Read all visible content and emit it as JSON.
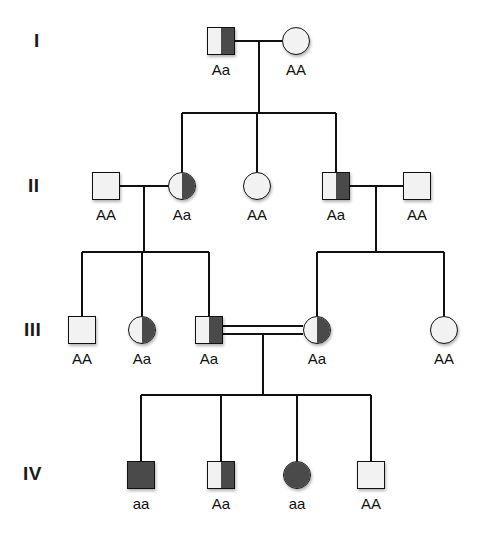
{
  "figure": {
    "type": "pedigree-chart",
    "symbol_key": {
      "square": "male",
      "circle": "female",
      "open": "homozygous dominant AA",
      "half_filled": "heterozygous carrier Aa",
      "filled": "homozygous recessive aa"
    },
    "colors": {
      "line": "#111111",
      "fill_affected": "#4a4a4a",
      "fill_unaffected": "#f2f2f2",
      "text": "#111111"
    }
  },
  "generations": [
    {
      "label": "I",
      "label_x": 34,
      "label_y": 31,
      "row_y": 27,
      "members": [
        {
          "id": "I-1",
          "sex": "male",
          "shape": "square",
          "fill": "half",
          "genotype": "Aa",
          "x": 207,
          "y": 27
        },
        {
          "id": "I-2",
          "sex": "female",
          "shape": "circle",
          "fill": "open",
          "genotype": "AA",
          "x": 282,
          "y": 27
        }
      ]
    },
    {
      "label": "II",
      "label_x": 28,
      "label_y": 176,
      "row_y": 172,
      "members": [
        {
          "id": "II-1",
          "sex": "male",
          "shape": "square",
          "fill": "open",
          "genotype": "AA",
          "x": 92,
          "y": 172
        },
        {
          "id": "II-2",
          "sex": "female",
          "shape": "circle",
          "fill": "half",
          "genotype": "Aa",
          "x": 168,
          "y": 172
        },
        {
          "id": "II-3",
          "sex": "female",
          "shape": "circle",
          "fill": "open",
          "genotype": "AA",
          "x": 243,
          "y": 172
        },
        {
          "id": "II-4",
          "sex": "male",
          "shape": "square",
          "fill": "half",
          "genotype": "Aa",
          "x": 322,
          "y": 172
        },
        {
          "id": "II-5",
          "sex": "male",
          "shape": "square",
          "fill": "open",
          "genotype": "AA",
          "x": 403,
          "y": 172
        }
      ]
    },
    {
      "label": "III",
      "label_x": 24,
      "label_y": 320,
      "row_y": 316,
      "members": [
        {
          "id": "III-1",
          "sex": "male",
          "shape": "square",
          "fill": "open",
          "genotype": "AA",
          "x": 68,
          "y": 316
        },
        {
          "id": "III-2",
          "sex": "female",
          "shape": "circle",
          "fill": "half",
          "genotype": "Aa",
          "x": 128,
          "y": 316
        },
        {
          "id": "III-3",
          "sex": "male",
          "shape": "square",
          "fill": "half",
          "genotype": "Aa",
          "x": 195,
          "y": 316
        },
        {
          "id": "III-4",
          "sex": "female",
          "shape": "circle",
          "fill": "half",
          "genotype": "Aa",
          "x": 303,
          "y": 316
        },
        {
          "id": "III-5",
          "sex": "female",
          "shape": "circle",
          "fill": "open",
          "genotype": "AA",
          "x": 430,
          "y": 316
        }
      ]
    },
    {
      "label": "IV",
      "label_x": 23,
      "label_y": 464,
      "row_y": 461,
      "members": [
        {
          "id": "IV-1",
          "sex": "male",
          "shape": "square",
          "fill": "full",
          "genotype": "aa",
          "x": 127,
          "y": 461
        },
        {
          "id": "IV-2",
          "sex": "male",
          "shape": "square",
          "fill": "half",
          "genotype": "Aa",
          "x": 207,
          "y": 461
        },
        {
          "id": "IV-3",
          "sex": "female",
          "shape": "circle",
          "fill": "full",
          "genotype": "aa",
          "x": 283,
          "y": 461
        },
        {
          "id": "IV-4",
          "sex": "male",
          "shape": "square",
          "fill": "open",
          "genotype": "AA",
          "x": 357,
          "y": 461
        }
      ]
    }
  ],
  "genotype_labels": [
    {
      "text": "Aa",
      "x": 191,
      "y": 62
    },
    {
      "text": "AA",
      "x": 266,
      "y": 62
    },
    {
      "text": "AA",
      "x": 76,
      "y": 207
    },
    {
      "text": "Aa",
      "x": 152,
      "y": 207
    },
    {
      "text": "AA",
      "x": 227,
      "y": 207
    },
    {
      "text": "Aa",
      "x": 306,
      "y": 207
    },
    {
      "text": "AA",
      "x": 387,
      "y": 207
    },
    {
      "text": "AA",
      "x": 52,
      "y": 351
    },
    {
      "text": "Aa",
      "x": 112,
      "y": 351
    },
    {
      "text": "Aa",
      "x": 179,
      "y": 351
    },
    {
      "text": "Aa",
      "x": 287,
      "y": 351
    },
    {
      "text": "AA",
      "x": 414,
      "y": 351
    },
    {
      "text": "aa",
      "x": 111,
      "y": 496
    },
    {
      "text": "Aa",
      "x": 191,
      "y": 496
    },
    {
      "text": "aa",
      "x": 267,
      "y": 496
    },
    {
      "text": "AA",
      "x": 341,
      "y": 496
    }
  ],
  "connections": {
    "matings": [
      {
        "id": "mating-I",
        "type": "single",
        "x1": 235,
        "x2": 282,
        "y": 41,
        "drop_x": 259,
        "drop_y1": 41,
        "drop_y2": 113
      },
      {
        "id": "mating-II-1",
        "type": "single",
        "x1": 120,
        "x2": 168,
        "y": 186,
        "drop_x": 144,
        "drop_y1": 186,
        "drop_y2": 252
      },
      {
        "id": "mating-II-4",
        "type": "single",
        "x1": 350,
        "x2": 403,
        "y": 186,
        "drop_x": 376,
        "drop_y1": 186,
        "drop_y2": 252
      },
      {
        "id": "mating-III-consanguineous",
        "type": "double",
        "x1": 223,
        "x2": 303,
        "y": 326,
        "y_b": 334,
        "drop_x": 263,
        "drop_y1": 334,
        "drop_y2": 395
      }
    ],
    "sibships": [
      {
        "id": "sibship-I",
        "y": 113,
        "x_start": 182,
        "x_end": 336,
        "children_x": [
          182,
          257,
          336
        ],
        "child_drop_to": 172
      },
      {
        "id": "sibship-II-left",
        "y": 252,
        "x_start": 82,
        "x_end": 209,
        "children_x": [
          82,
          142,
          209
        ],
        "child_drop_to": 316
      },
      {
        "id": "sibship-II-right",
        "y": 252,
        "x_start": 317,
        "x_end": 444,
        "children_x": [
          317,
          444
        ],
        "child_drop_to": 316
      },
      {
        "id": "sibship-III",
        "y": 395,
        "x_start": 141,
        "x_end": 371,
        "children_x": [
          141,
          221,
          297,
          371
        ],
        "child_drop_to": 461
      }
    ]
  }
}
